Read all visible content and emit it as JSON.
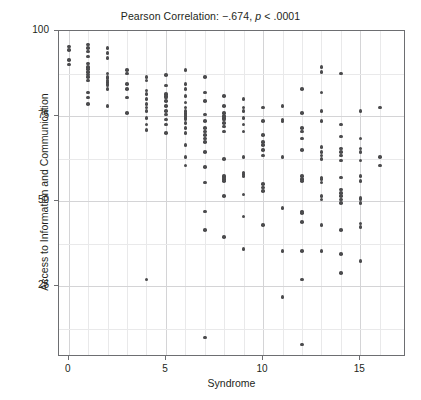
{
  "chart_data": {
    "type": "scatter",
    "title": "Pearson Correlation: −.674, p < .0001",
    "title_prefix": "Pearson Correlation: −.674, ",
    "title_italic": "p",
    "title_suffix": " < .0001",
    "xlabel": "Syndrome",
    "ylabel": "Access to Information and Communication",
    "xlim": [
      -0.5,
      17.35
    ],
    "ylim": [
      4.3,
      100
    ],
    "xticks": [
      0,
      5,
      10,
      15
    ],
    "yticks": [
      25,
      50,
      75,
      100
    ],
    "xtick_labels": [
      "0",
      "5",
      "10",
      "15"
    ],
    "ytick_labels": [
      "25",
      "50",
      "75",
      "100"
    ],
    "x_minor_gridlines": [
      0,
      1,
      2,
      3,
      4,
      5,
      6,
      7,
      8,
      9,
      10,
      11,
      12,
      13,
      14,
      15,
      16
    ],
    "y_minor_gridlines": [
      12.5,
      37.5,
      62.5,
      87.5
    ],
    "grid": true,
    "legend": null,
    "marker_color": "#4b4b4d",
    "marker_size_px": 3.6,
    "n_points": 186,
    "correlation_r": -0.674,
    "p_value": "< .0001",
    "points": [
      [
        0,
        95.5
      ],
      [
        0,
        94.5
      ],
      [
        0,
        91.5
      ],
      [
        0,
        90.2
      ],
      [
        1,
        96.0
      ],
      [
        1,
        95.0
      ],
      [
        1,
        94.0
      ],
      [
        1,
        92.5
      ],
      [
        1,
        90.5
      ],
      [
        1,
        89.5
      ],
      [
        1,
        88.8
      ],
      [
        1,
        88.0
      ],
      [
        1,
        87.2
      ],
      [
        1,
        86.5
      ],
      [
        1,
        85.5
      ],
      [
        1,
        82.0
      ],
      [
        1,
        80.5
      ],
      [
        1,
        78.5
      ],
      [
        2,
        95.0
      ],
      [
        2,
        93.5
      ],
      [
        2,
        92.0
      ],
      [
        2,
        87.5
      ],
      [
        2,
        86.5
      ],
      [
        2,
        86.0
      ],
      [
        2,
        85.5
      ],
      [
        2,
        85.0
      ],
      [
        2,
        84.5
      ],
      [
        2,
        84.0
      ],
      [
        2,
        83.0
      ],
      [
        2,
        78.0
      ],
      [
        3,
        88.5
      ],
      [
        3,
        87.5
      ],
      [
        3,
        84.5
      ],
      [
        3,
        83.0
      ],
      [
        3,
        80.5
      ],
      [
        3,
        76.0
      ],
      [
        4,
        86.5
      ],
      [
        4,
        85.5
      ],
      [
        4,
        82.5
      ],
      [
        4,
        81.5
      ],
      [
        4,
        80.0
      ],
      [
        4,
        78.5
      ],
      [
        4,
        77.5
      ],
      [
        4,
        76.5
      ],
      [
        4,
        74.5
      ],
      [
        4,
        72.5
      ],
      [
        4,
        71.0
      ],
      [
        4,
        27.0
      ],
      [
        5,
        87.0
      ],
      [
        5,
        84.0
      ],
      [
        5,
        81.5
      ],
      [
        5,
        81.0
      ],
      [
        5,
        80.5
      ],
      [
        5,
        79.5
      ],
      [
        5,
        78.0
      ],
      [
        5,
        76.5
      ],
      [
        5,
        75.5
      ],
      [
        5,
        74.0
      ],
      [
        5,
        72.5
      ],
      [
        5,
        70.0
      ],
      [
        6,
        88.5
      ],
      [
        6,
        84.5
      ],
      [
        6,
        83.0
      ],
      [
        6,
        81.0
      ],
      [
        6,
        79.0
      ],
      [
        6,
        77.5
      ],
      [
        6,
        76.5
      ],
      [
        6,
        76.0
      ],
      [
        6,
        75.5
      ],
      [
        6,
        75.0
      ],
      [
        6,
        74.5
      ],
      [
        6,
        74.0
      ],
      [
        6,
        73.0
      ],
      [
        6,
        71.5
      ],
      [
        6,
        70.0
      ],
      [
        6,
        66.5
      ],
      [
        6,
        63.0
      ],
      [
        6,
        60.5
      ],
      [
        7,
        86.5
      ],
      [
        7,
        82.0
      ],
      [
        7,
        79.5
      ],
      [
        7,
        75.5
      ],
      [
        7,
        73.5
      ],
      [
        7,
        71.5
      ],
      [
        7,
        70.5
      ],
      [
        7,
        69.5
      ],
      [
        7,
        68.5
      ],
      [
        7,
        67.5
      ],
      [
        7,
        64.5
      ],
      [
        7,
        60.0
      ],
      [
        7,
        55.5
      ],
      [
        7,
        47.0
      ],
      [
        7,
        41.5
      ],
      [
        7,
        10.0
      ],
      [
        8,
        81.0
      ],
      [
        8,
        78.0
      ],
      [
        8,
        76.0
      ],
      [
        8,
        75.0
      ],
      [
        8,
        74.5
      ],
      [
        8,
        74.0
      ],
      [
        8,
        73.0
      ],
      [
        8,
        72.0
      ],
      [
        8,
        70.5
      ],
      [
        8,
        62.5
      ],
      [
        8,
        57.5
      ],
      [
        8,
        57.0
      ],
      [
        8,
        56.5
      ],
      [
        8,
        56.0
      ],
      [
        8,
        51.5
      ],
      [
        8,
        39.5
      ],
      [
        9,
        80.0
      ],
      [
        9,
        77.5
      ],
      [
        9,
        76.5
      ],
      [
        9,
        74.5
      ],
      [
        9,
        72.5
      ],
      [
        9,
        70.5
      ],
      [
        9,
        63.0
      ],
      [
        9,
        58.5
      ],
      [
        9,
        58.0
      ],
      [
        9,
        57.5
      ],
      [
        9,
        52.0
      ],
      [
        9,
        45.5
      ],
      [
        9,
        36.0
      ],
      [
        10,
        77.5
      ],
      [
        10,
        73.5
      ],
      [
        10,
        69.5
      ],
      [
        10,
        67.5
      ],
      [
        10,
        66.5
      ],
      [
        10,
        65.0
      ],
      [
        10,
        63.5
      ],
      [
        10,
        55.0
      ],
      [
        10,
        54.0
      ],
      [
        10,
        53.0
      ],
      [
        10,
        43.0
      ],
      [
        11,
        78.0
      ],
      [
        11,
        74.0
      ],
      [
        11,
        73.5
      ],
      [
        11,
        63.0
      ],
      [
        11,
        48.0
      ],
      [
        11,
        35.5
      ],
      [
        11,
        22.0
      ],
      [
        12,
        83.0
      ],
      [
        12,
        76.0
      ],
      [
        12,
        71.5
      ],
      [
        12,
        70.5
      ],
      [
        12,
        68.5
      ],
      [
        12,
        65.0
      ],
      [
        12,
        57.5
      ],
      [
        12,
        56.5
      ],
      [
        12,
        56.0
      ],
      [
        12,
        47.0
      ],
      [
        12,
        46.5
      ],
      [
        12,
        44.0
      ],
      [
        12,
        35.5
      ],
      [
        12,
        27.0
      ],
      [
        12,
        8.0
      ],
      [
        13,
        89.5
      ],
      [
        13,
        88.0
      ],
      [
        13,
        82.0
      ],
      [
        13,
        76.5
      ],
      [
        13,
        73.5
      ],
      [
        13,
        66.0
      ],
      [
        13,
        64.5
      ],
      [
        13,
        63.5
      ],
      [
        13,
        62.5
      ],
      [
        13,
        57.0
      ],
      [
        13,
        56.5
      ],
      [
        13,
        55.5
      ],
      [
        13,
        51.5
      ],
      [
        13,
        50.5
      ],
      [
        13,
        43.0
      ],
      [
        13,
        35.5
      ],
      [
        14,
        87.5
      ],
      [
        14,
        72.5
      ],
      [
        14,
        69.0
      ],
      [
        14,
        65.5
      ],
      [
        14,
        64.5
      ],
      [
        14,
        63.5
      ],
      [
        14,
        62.0
      ],
      [
        14,
        57.0
      ],
      [
        14,
        53.5
      ],
      [
        14,
        52.5
      ],
      [
        14,
        51.5
      ],
      [
        14,
        50.5
      ],
      [
        14,
        49.5
      ],
      [
        14,
        41.5
      ],
      [
        14,
        34.5
      ],
      [
        14,
        29.0
      ],
      [
        15,
        76.5
      ],
      [
        15,
        68.5
      ],
      [
        15,
        65.5
      ],
      [
        15,
        64.5
      ],
      [
        15,
        62.0
      ],
      [
        15,
        57.5
      ],
      [
        15,
        56.0
      ],
      [
        15,
        51.0
      ],
      [
        15,
        50.5
      ],
      [
        15,
        49.5
      ],
      [
        15,
        43.5
      ],
      [
        15,
        42.5
      ],
      [
        15,
        32.5
      ],
      [
        16,
        77.5
      ],
      [
        16,
        63.0
      ],
      [
        16,
        60.5
      ]
    ]
  }
}
